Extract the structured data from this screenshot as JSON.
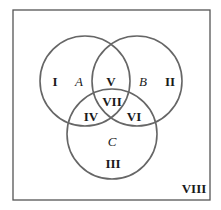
{
  "diagram": {
    "type": "venn",
    "universe": {
      "label": "VIII",
      "stroke": "#555555"
    },
    "sets": [
      {
        "name": "A",
        "cx": 85,
        "cy": 81,
        "r": 45
      },
      {
        "name": "B",
        "cx": 137,
        "cy": 81,
        "r": 45
      },
      {
        "name": "C",
        "cx": 112,
        "cy": 134,
        "r": 45
      }
    ],
    "regions": [
      {
        "id": "I",
        "label": "I",
        "x": 55,
        "y": 86
      },
      {
        "id": "II",
        "label": "II",
        "x": 170,
        "y": 86
      },
      {
        "id": "III",
        "label": "III",
        "x": 113,
        "y": 168
      },
      {
        "id": "IV",
        "label": "IV",
        "x": 91,
        "y": 121
      },
      {
        "id": "V",
        "label": "V",
        "x": 111,
        "y": 86
      },
      {
        "id": "VI",
        "label": "VI",
        "x": 134,
        "y": 121
      },
      {
        "id": "VII",
        "label": "VII",
        "x": 112,
        "y": 106
      },
      {
        "id": "VIII",
        "label": "VIII",
        "x": 194,
        "y": 193
      }
    ],
    "circle_stroke": "#666666"
  }
}
